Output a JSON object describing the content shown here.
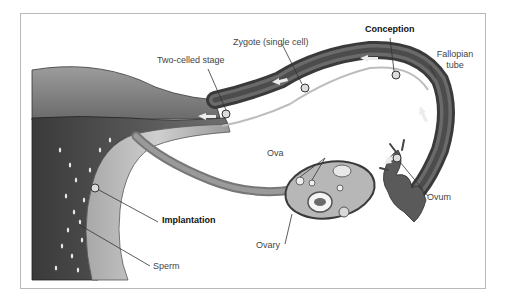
{
  "diagram": {
    "labels": {
      "two_celled": "Two-celled stage",
      "zygote": "Zygote (single cell)",
      "conception": "Conception",
      "fallopian_line1": "Fallopian",
      "fallopian_line2": "tube",
      "ova": "Ova",
      "ovum": "Ovum",
      "ovary": "Ovary",
      "implantation": "Implantation",
      "sperm": "Sperm"
    },
    "bold_labels": [
      "Conception",
      "Implantation"
    ],
    "colors": {
      "frame_border": "#b9b9b9",
      "tissue_dark": "#4a4a4a",
      "tissue_mid": "#8a8a8a",
      "tissue_light": "#c8c8c8",
      "label_text": "#444444",
      "bold_text": "#111111"
    }
  }
}
